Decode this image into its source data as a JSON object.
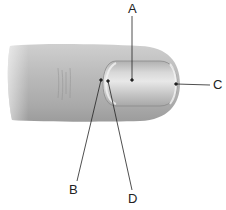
{
  "diagram": {
    "labels": [
      {
        "id": "A",
        "text": "A",
        "x": 128,
        "y": 2
      },
      {
        "id": "B",
        "text": "B",
        "x": 69,
        "y": 183
      },
      {
        "id": "C",
        "text": "C",
        "x": 213,
        "y": 78
      },
      {
        "id": "D",
        "text": "D",
        "x": 128,
        "y": 192
      }
    ],
    "colors": {
      "skin": "#b9b9b9",
      "skin_dark": "#9a9a9a",
      "nail": "#c8c8c8",
      "nail_highlight": "#e6e6e6",
      "line": "#222222"
    }
  }
}
